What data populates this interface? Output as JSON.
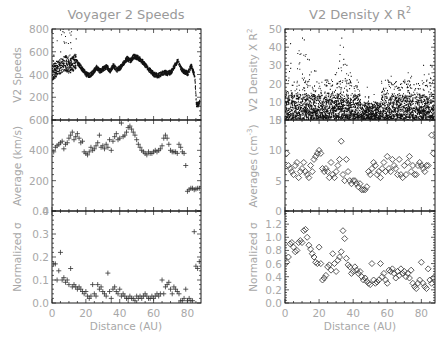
{
  "chart_data": [
    {
      "type": "scatter",
      "panel": "left-top",
      "title": "Voyager 2 Speeds",
      "xlabel": "",
      "ylabel": "V2 Speeds",
      "xlim": [
        0,
        88
      ],
      "ylim": [
        0,
        800
      ],
      "yticks": [
        0,
        200,
        400,
        600,
        800
      ],
      "marker": "dot",
      "description": "Dense time series of solar wind speed vs heliocentric distance; ~450 km/s with peaks to ~600, dropping to ~150 after 84 AU",
      "envelope": {
        "x": [
          0,
          2,
          4,
          6,
          8,
          10,
          12,
          14,
          16,
          18,
          20,
          22,
          24,
          26,
          28,
          30,
          32,
          34,
          36,
          38,
          40,
          42,
          44,
          46,
          48,
          50,
          52,
          54,
          56,
          58,
          60,
          62,
          64,
          66,
          68,
          70,
          72,
          74,
          76,
          78,
          80,
          82,
          83,
          84,
          85,
          86,
          87
        ],
        "y": [
          420,
          440,
          470,
          480,
          500,
          470,
          490,
          520,
          480,
          440,
          400,
          390,
          420,
          460,
          430,
          450,
          470,
          430,
          480,
          440,
          460,
          500,
          540,
          520,
          560,
          550,
          530,
          500,
          460,
          430,
          400,
          390,
          400,
          420,
          410,
          420,
          470,
          520,
          450,
          420,
          410,
          480,
          430,
          390,
          140,
          130,
          160
        ]
      }
    },
    {
      "type": "scatter",
      "panel": "left-middle",
      "ylabel": "Average (km/s)",
      "xlim": [
        0,
        88
      ],
      "ylim": [
        0,
        600
      ],
      "yticks": [
        0,
        200,
        400,
        600
      ],
      "marker": "plus",
      "x": [
        1,
        2,
        3,
        4,
        5,
        6,
        7,
        8,
        9,
        10,
        11,
        12,
        13,
        14,
        15,
        16,
        17,
        18,
        19,
        20,
        21,
        22,
        23,
        24,
        25,
        26,
        27,
        28,
        29,
        30,
        31,
        32,
        33,
        34,
        35,
        36,
        37,
        38,
        39,
        40,
        41,
        42,
        43,
        44,
        45,
        46,
        47,
        48,
        49,
        50,
        51,
        52,
        53,
        54,
        55,
        56,
        57,
        58,
        59,
        60,
        61,
        62,
        63,
        64,
        65,
        66,
        67,
        68,
        69,
        70,
        71,
        72,
        73,
        74,
        75,
        76,
        77,
        78,
        79,
        80,
        81,
        82,
        83,
        84,
        85,
        86,
        87
      ],
      "y": [
        390,
        420,
        430,
        440,
        450,
        460,
        410,
        440,
        450,
        480,
        500,
        520,
        470,
        490,
        510,
        480,
        450,
        460,
        390,
        380,
        370,
        390,
        420,
        400,
        410,
        430,
        450,
        500,
        420,
        430,
        410,
        440,
        420,
        470,
        400,
        460,
        490,
        510,
        470,
        480,
        580,
        490,
        500,
        520,
        550,
        560,
        540,
        520,
        500,
        470,
        440,
        420,
        400,
        390,
        380,
        370,
        390,
        380,
        380,
        390,
        400,
        390,
        400,
        410,
        430,
        480,
        500,
        480,
        440,
        400,
        390,
        390,
        390,
        380,
        440,
        420,
        390,
        380,
        300,
        130,
        140,
        150,
        150,
        140,
        145,
        150,
        150
      ]
    },
    {
      "type": "scatter",
      "panel": "left-bottom",
      "xlabel": "Distance (AU)",
      "ylabel": "Normalized σ",
      "xlim": [
        0,
        88
      ],
      "ylim": [
        0,
        0.4
      ],
      "yticks": [
        0.0,
        0.1,
        0.2,
        0.3,
        0.4
      ],
      "xticks": [
        0,
        20,
        40,
        60,
        80
      ],
      "marker": "plus",
      "x": [
        1,
        2,
        3,
        4,
        5,
        6,
        7,
        8,
        9,
        10,
        11,
        12,
        13,
        14,
        15,
        16,
        17,
        18,
        19,
        20,
        21,
        22,
        23,
        24,
        25,
        26,
        27,
        28,
        29,
        30,
        31,
        32,
        33,
        34,
        35,
        36,
        37,
        38,
        39,
        40,
        41,
        42,
        43,
        44,
        45,
        46,
        47,
        48,
        49,
        50,
        51,
        52,
        53,
        54,
        55,
        56,
        57,
        58,
        59,
        60,
        61,
        62,
        63,
        64,
        65,
        66,
        67,
        68,
        69,
        70,
        71,
        72,
        73,
        74,
        75,
        76,
        77,
        78,
        79,
        80,
        81,
        82,
        83,
        84,
        85,
        86,
        87
      ],
      "y": [
        0.17,
        0.17,
        0.1,
        0.14,
        0.22,
        0.1,
        0.11,
        0.09,
        0.1,
        0.08,
        0.15,
        0.07,
        0.08,
        0.07,
        0.06,
        0.07,
        0.06,
        0.05,
        0.04,
        0.05,
        0.03,
        0.02,
        0.03,
        0.08,
        0.04,
        0.03,
        0.08,
        0.06,
        0.07,
        0.05,
        0.04,
        0.03,
        0.13,
        0.05,
        0.02,
        0.06,
        0.07,
        0.05,
        0.04,
        0.06,
        0.03,
        0.04,
        0.03,
        0.02,
        0.02,
        0.03,
        0.02,
        0.02,
        0.01,
        0.03,
        0.02,
        0.03,
        0.02,
        0.03,
        0.04,
        0.03,
        0.02,
        0.02,
        0.03,
        0.02,
        0.03,
        0.04,
        0.03,
        0.04,
        0.1,
        0.04,
        0.07,
        0.08,
        0.09,
        0.06,
        0.04,
        0.07,
        0.06,
        0.05,
        0.04,
        0.01,
        0.01,
        0.02,
        0.06,
        0.01,
        0.02,
        0.01,
        0.01,
        0.31,
        0.16,
        0.15,
        0.18
      ]
    },
    {
      "type": "scatter",
      "panel": "right-top",
      "title": "V2 Density X R²",
      "xlabel": "",
      "ylabel": "V2 Density X R²",
      "xlim": [
        0,
        88
      ],
      "ylim": [
        0,
        50
      ],
      "yticks": [
        0,
        10,
        20,
        30,
        40,
        50
      ],
      "marker": "dot",
      "description": "Dense scatter of normalized density; bulk between 0 and ~15 with spikes up to ~45",
      "spikes": {
        "x": [
          3,
          8,
          10,
          11,
          12,
          14,
          17,
          24,
          27,
          30,
          32,
          33,
          34,
          36,
          38,
          42,
          48,
          52,
          58,
          60,
          62,
          64,
          66,
          68,
          70,
          72,
          74,
          78,
          81,
          83,
          85,
          86
        ],
        "y": [
          42,
          38,
          45,
          44,
          36,
          33,
          27,
          22,
          22,
          26,
          36,
          45,
          40,
          30,
          26,
          22,
          18,
          14,
          16,
          22,
          24,
          20,
          18,
          18,
          22,
          26,
          24,
          20,
          30,
          22,
          30,
          26
        ]
      }
    },
    {
      "type": "scatter",
      "panel": "right-middle",
      "ylabel": "Averages (cm⁻³)",
      "xlim": [
        0,
        88
      ],
      "ylim": [
        0,
        15
      ],
      "yticks": [
        0,
        5,
        10,
        15
      ],
      "marker": "diamond",
      "x": [
        1,
        2,
        3,
        4,
        5,
        6,
        7,
        8,
        9,
        10,
        11,
        12,
        13,
        14,
        15,
        16,
        17,
        18,
        19,
        20,
        21,
        22,
        23,
        24,
        25,
        26,
        27,
        28,
        29,
        30,
        31,
        32,
        33,
        34,
        35,
        36,
        37,
        38,
        39,
        40,
        41,
        42,
        43,
        44,
        45,
        46,
        47,
        48,
        49,
        50,
        51,
        52,
        53,
        54,
        55,
        56,
        57,
        58,
        59,
        60,
        61,
        62,
        63,
        64,
        65,
        66,
        67,
        68,
        69,
        70,
        71,
        72,
        73,
        74,
        75,
        76,
        77,
        78,
        79,
        80,
        81,
        82,
        83,
        84,
        85,
        86,
        87
      ],
      "y": [
        9.5,
        7.5,
        7.0,
        6.5,
        6.0,
        7.5,
        8.0,
        5.5,
        6.5,
        7.0,
        8.0,
        6.5,
        6.0,
        5.5,
        7.5,
        6.5,
        8.5,
        9.0,
        9.5,
        10.0,
        9.5,
        7.0,
        6.5,
        7.0,
        6.5,
        5.5,
        8.0,
        6.0,
        5.5,
        6.5,
        7.5,
        8.5,
        11.5,
        6.0,
        5.0,
        8.5,
        6.5,
        5.0,
        4.5,
        5.0,
        5.0,
        4.5,
        4.0,
        4.5,
        3.5,
        3.5,
        3.5,
        4.0,
        6.5,
        6.0,
        7.0,
        8.0,
        7.5,
        6.0,
        6.5,
        5.5,
        7.0,
        8.0,
        6.5,
        9.0,
        7.0,
        6.5,
        8.5,
        7.5,
        7.0,
        6.0,
        8.5,
        6.0,
        5.5,
        7.5,
        6.0,
        8.0,
        9.0,
        6.5,
        7.5,
        6.0,
        6.0,
        7.5,
        8.0,
        7.5,
        7.0,
        6.5,
        7.5,
        7.5,
        15.5,
        12.5,
        9.5
      ]
    },
    {
      "type": "scatter",
      "panel": "right-bottom",
      "xlabel": "Distance (AU)",
      "ylabel": "Normalized σ",
      "xlim": [
        0,
        88
      ],
      "ylim": [
        0,
        1.4
      ],
      "yticks": [
        0.0,
        0.2,
        0.4,
        0.6,
        0.8,
        1.0,
        1.2
      ],
      "xticks": [
        0,
        20,
        40,
        60,
        80
      ],
      "marker": "diamond",
      "x": [
        1,
        2,
        3,
        4,
        5,
        6,
        7,
        8,
        9,
        10,
        11,
        12,
        13,
        14,
        15,
        16,
        17,
        18,
        19,
        20,
        21,
        22,
        23,
        24,
        25,
        26,
        27,
        28,
        29,
        30,
        31,
        32,
        33,
        34,
        35,
        36,
        37,
        38,
        39,
        40,
        41,
        42,
        43,
        44,
        45,
        46,
        47,
        48,
        49,
        50,
        51,
        52,
        53,
        54,
        55,
        56,
        57,
        58,
        59,
        60,
        61,
        62,
        63,
        64,
        65,
        66,
        67,
        68,
        69,
        70,
        71,
        72,
        73,
        74,
        75,
        76,
        77,
        78,
        79,
        80,
        81,
        82,
        83,
        84,
        85,
        86,
        87
      ],
      "y": [
        0.62,
        0.7,
        0.9,
        0.92,
        0.85,
        0.78,
        0.8,
        0.92,
        0.95,
        0.92,
        1.1,
        1.12,
        1.0,
        0.88,
        0.82,
        0.75,
        0.7,
        0.62,
        0.6,
        0.85,
        0.6,
        0.35,
        0.38,
        0.42,
        0.55,
        0.58,
        0.5,
        0.75,
        0.6,
        0.48,
        0.65,
        0.7,
        0.78,
        1.1,
        0.98,
        0.68,
        0.58,
        0.55,
        0.45,
        0.48,
        0.55,
        0.5,
        0.45,
        0.48,
        0.4,
        0.35,
        0.38,
        0.33,
        0.3,
        0.28,
        0.6,
        0.35,
        0.3,
        0.32,
        0.35,
        0.6,
        0.4,
        0.45,
        0.35,
        0.3,
        0.5,
        0.48,
        0.52,
        0.45,
        0.38,
        0.48,
        0.42,
        0.52,
        0.45,
        0.48,
        0.4,
        0.45,
        0.38,
        0.5,
        0.3,
        0.25,
        0.22,
        0.3,
        0.35,
        0.62,
        0.3,
        0.25,
        0.22,
        0.52,
        0.35,
        0.3,
        0.38
      ]
    }
  ],
  "figure": {
    "left_title": "Voyager 2 Speeds",
    "right_title_main": "V2 Density X R",
    "right_title_sup": "2",
    "left_ylabels": [
      "V2 Speeds",
      "Average (km/s)",
      "Normalized σ"
    ],
    "right_ylabels_top_main": "V2 Density X R",
    "right_ylabels_top_sup": "2",
    "right_ylabels_mid_pre": "Averages (cm",
    "right_ylabels_mid_sup": "-3",
    "right_ylabels_mid_post": ")",
    "right_ylabel_bottom": "Normalized σ",
    "xlabel": "Distance (AU)",
    "xticks": [
      "0",
      "20",
      "40",
      "60",
      "80"
    ]
  }
}
